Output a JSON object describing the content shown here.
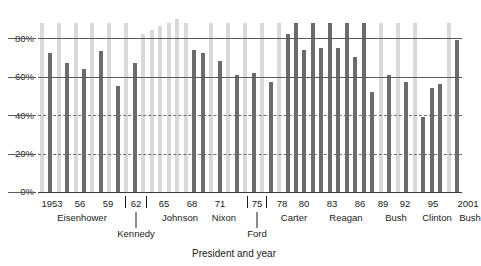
{
  "chart_data": {
    "type": "bar",
    "title": "",
    "xlabel": "President and year",
    "ylabel": "",
    "ylim": [
      0,
      100
    ],
    "grid": true,
    "legend": null,
    "y_ticks": [
      "0%",
      "20%",
      "40%",
      "60%",
      "80%"
    ],
    "y_tick_values": [
      0,
      20,
      40,
      60,
      80
    ],
    "x_tick_labels": [
      "1953",
      "56",
      "59",
      "62",
      "65",
      "68",
      "71",
      "75",
      "78",
      "80",
      "83",
      "86",
      "89",
      "92",
      "95",
      "2001"
    ],
    "group_labels": [
      "Eisenhower",
      "Kennedy",
      "Johnson",
      "Nixon",
      "Ford",
      "Carter",
      "Reagan",
      "Bush",
      "Clinton",
      "Bush"
    ],
    "series_names": [
      "odd-year",
      "even-year"
    ],
    "colors": {
      "light": "#d9d9d9",
      "dark": "#6b6b6b",
      "axis": "#3d3d3d",
      "grid": "#5a5a5a",
      "text": "#1a1a1a"
    },
    "categories": [
      "1953",
      "1954",
      "1955",
      "1956",
      "1957",
      "1958",
      "1959",
      "1960",
      "1961",
      "1962",
      "1963",
      "1964",
      "1965",
      "1966",
      "1967",
      "1968",
      "1969",
      "1970",
      "1971",
      "1972",
      "1973",
      "1974",
      "1975",
      "1976",
      "1977",
      "1978",
      "1979",
      "1980",
      "1981",
      "1982",
      "1983",
      "1984",
      "1985",
      "1986",
      "1987",
      "1988",
      "1989",
      "1990",
      "1991",
      "1992",
      "1993",
      "1994",
      "1995",
      "1996",
      "1997",
      "1998",
      "1999",
      "2000",
      "2001",
      "2002"
    ],
    "values": [
      88,
      72,
      88,
      67,
      88,
      64,
      88,
      73,
      88,
      55,
      88,
      67,
      82,
      84,
      86,
      88,
      90,
      88,
      74,
      72,
      88,
      68,
      88,
      61,
      88,
      62,
      88,
      57,
      88,
      82,
      88,
      74,
      88,
      75,
      88,
      75,
      88,
      70,
      88,
      52,
      88,
      61,
      88,
      57,
      88,
      39,
      54,
      56,
      88,
      79
    ],
    "shade": [
      "light",
      "dark",
      "light",
      "dark",
      "light",
      "dark",
      "light",
      "dark",
      "light",
      "dark",
      "light",
      "dark",
      "light",
      "light",
      "light",
      "light",
      "light",
      "light",
      "dark",
      "dark",
      "light",
      "dark",
      "light",
      "dark",
      "light",
      "dark",
      "light",
      "dark",
      "light",
      "dark",
      "dark",
      "dark",
      "dark",
      "dark",
      "dark",
      "dark",
      "dark",
      "dark",
      "dark",
      "dark",
      "light",
      "dark",
      "light",
      "dark",
      "light",
      "dark",
      "dark",
      "dark",
      "light",
      "dark"
    ]
  }
}
